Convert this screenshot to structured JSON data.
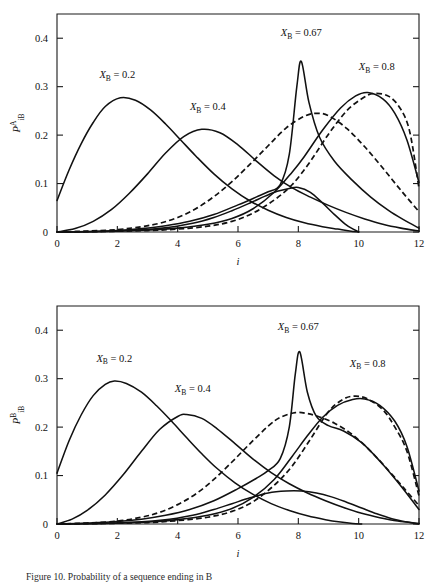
{
  "figure": {
    "caption": "Figure 10.  Probability of a sequence ending in B",
    "x_axis_label": "i",
    "line_styles": {
      "solid": "solid",
      "dashed": "dashed"
    },
    "ink_color": "#111111",
    "background_color": "#ffffff"
  },
  "chart_data": [
    {
      "id": "top",
      "type": "line",
      "title": "",
      "xlabel": "i",
      "ylabel": "P_iB^A",
      "ylabel_parts": {
        "base": "P",
        "sub": "iB",
        "sup": "A"
      },
      "xlim": [
        0,
        12
      ],
      "ylim": [
        0,
        0.45
      ],
      "xticks": [
        0,
        2,
        4,
        6,
        8,
        10,
        12
      ],
      "yticks": [
        0,
        0.1,
        0.2,
        0.3,
        0.4
      ],
      "xtick_labels": [
        "0",
        "2",
        "4",
        "6",
        "8",
        "10",
        "12"
      ],
      "ytick_labels": [
        "0",
        "0.1",
        "0.2",
        "0.3",
        "0.4"
      ],
      "grid": false,
      "legend": "inline-annotations",
      "annotations": [
        {
          "text": "X_B = 0.2",
          "base": "X",
          "sub": "B",
          "value": "0.2",
          "x": 2.0,
          "y": 0.318
        },
        {
          "text": "X_B = 0.4",
          "base": "X",
          "sub": "B",
          "value": "0.4",
          "x": 5.0,
          "y": 0.252
        },
        {
          "text": "X_B = 0.67",
          "base": "X",
          "sub": "B",
          "value": "0.67",
          "x": 8.1,
          "y": 0.404
        },
        {
          "text": "X_B = 0.8",
          "base": "X",
          "sub": "B",
          "value": "0.8",
          "x": 10.6,
          "y": 0.334
        }
      ],
      "series": [
        {
          "name": "X_B = 0.2",
          "style": "solid",
          "x": [
            0,
            0.4,
            0.8,
            1.2,
            1.6,
            2.1,
            2.6,
            3.1,
            3.6,
            4.1,
            4.6,
            5.2,
            5.8,
            6.4,
            7.0,
            7.6,
            8.2,
            8.8,
            9.3,
            9.7,
            10.0
          ],
          "values": [
            0.065,
            0.128,
            0.182,
            0.226,
            0.259,
            0.277,
            0.272,
            0.252,
            0.223,
            0.19,
            0.157,
            0.12,
            0.089,
            0.064,
            0.045,
            0.03,
            0.019,
            0.011,
            0.006,
            0.002,
            0.0
          ]
        },
        {
          "name": "X_B = 0.4",
          "style": "solid",
          "x": [
            0,
            0.6,
            1.2,
            1.8,
            2.4,
            3.0,
            3.6,
            4.2,
            4.8,
            5.4,
            6.0,
            6.6,
            7.2,
            7.8,
            8.4,
            9.0,
            9.6,
            10.2,
            10.8,
            11.4,
            12.0
          ],
          "values": [
            0.0,
            0.007,
            0.022,
            0.046,
            0.08,
            0.12,
            0.163,
            0.197,
            0.212,
            0.205,
            0.18,
            0.147,
            0.116,
            0.091,
            0.072,
            0.055,
            0.04,
            0.027,
            0.016,
            0.008,
            0.002
          ]
        },
        {
          "name": "X_B = 0.67 solid",
          "style": "solid",
          "x": [
            0,
            1.0,
            2.0,
            2.8,
            3.6,
            4.4,
            5.2,
            6.0,
            6.6,
            7.0,
            7.4,
            7.7,
            7.95,
            8.1,
            8.35,
            8.7,
            9.2,
            9.8,
            10.4,
            11.0,
            11.5,
            12.0
          ],
          "values": [
            0.0,
            0.001,
            0.003,
            0.007,
            0.013,
            0.022,
            0.036,
            0.056,
            0.072,
            0.083,
            0.098,
            0.16,
            0.3,
            0.352,
            0.268,
            0.196,
            0.146,
            0.106,
            0.072,
            0.044,
            0.025,
            0.008
          ]
        },
        {
          "name": "X_B = 0.67 dashed",
          "style": "dashed",
          "x": [
            0,
            1.0,
            2.0,
            2.8,
            3.4,
            4.0,
            4.6,
            5.2,
            5.8,
            6.4,
            7.0,
            7.6,
            8.2,
            8.6,
            9.0,
            9.6,
            10.2,
            10.8,
            11.4,
            12.0
          ],
          "values": [
            0.0,
            0.002,
            0.005,
            0.011,
            0.018,
            0.03,
            0.048,
            0.073,
            0.104,
            0.14,
            0.178,
            0.215,
            0.239,
            0.245,
            0.24,
            0.214,
            0.176,
            0.132,
            0.086,
            0.042
          ]
        },
        {
          "name": "X_B = 0.8 solid",
          "style": "solid",
          "x": [
            0,
            1.5,
            3.0,
            4.0,
            5.0,
            5.8,
            6.5,
            7.2,
            7.8,
            8.2,
            8.8,
            9.4,
            9.9,
            10.3,
            10.8,
            11.2,
            11.6,
            12.0
          ],
          "values": [
            0.0,
            0.001,
            0.004,
            0.008,
            0.016,
            0.028,
            0.048,
            0.082,
            0.124,
            0.156,
            0.21,
            0.256,
            0.281,
            0.288,
            0.275,
            0.245,
            0.19,
            0.102
          ]
        },
        {
          "name": "X_B = 0.8 dashed",
          "style": "dashed",
          "x": [
            0,
            1.5,
            3.0,
            4.0,
            5.0,
            5.8,
            6.5,
            7.2,
            7.8,
            8.4,
            9.0,
            9.6,
            10.1,
            10.5,
            11.0,
            11.4,
            11.7,
            12.0
          ],
          "values": [
            0.0,
            0.001,
            0.003,
            0.006,
            0.012,
            0.022,
            0.039,
            0.066,
            0.098,
            0.146,
            0.202,
            0.25,
            0.275,
            0.286,
            0.28,
            0.253,
            0.205,
            0.09
          ]
        },
        {
          "name": "low tail solid",
          "style": "solid",
          "x": [
            0,
            2.0,
            3.5,
            4.5,
            5.2,
            5.8,
            6.4,
            6.9,
            7.3,
            7.7,
            8.0,
            8.4,
            8.8,
            9.2,
            9.6,
            10.0
          ],
          "values": [
            0.0,
            0.002,
            0.008,
            0.018,
            0.03,
            0.044,
            0.06,
            0.074,
            0.084,
            0.09,
            0.092,
            0.082,
            0.06,
            0.036,
            0.014,
            0.0
          ]
        }
      ]
    },
    {
      "id": "bottom",
      "type": "line",
      "title": "",
      "xlabel": "i",
      "ylabel": "P_iB^B",
      "ylabel_parts": {
        "base": "P",
        "sub": "iB",
        "sup": "B"
      },
      "xlim": [
        0,
        12
      ],
      "ylim": [
        0,
        0.45
      ],
      "xticks": [
        0,
        2,
        4,
        6,
        8,
        10,
        12
      ],
      "yticks": [
        0,
        0.1,
        0.2,
        0.3,
        0.4
      ],
      "xtick_labels": [
        "0",
        "2",
        "4",
        "6",
        "8",
        "10",
        "12"
      ],
      "ytick_labels": [
        "0",
        "0.1",
        "0.2",
        "0.3",
        "0.4"
      ],
      "grid": false,
      "legend": "inline-annotations",
      "annotations": [
        {
          "text": "X_B = 0.2",
          "base": "X",
          "sub": "B",
          "value": "0.2",
          "x": 1.9,
          "y": 0.335
        },
        {
          "text": "X_B = 0.4",
          "base": "X",
          "sub": "B",
          "value": "0.4",
          "x": 4.5,
          "y": 0.272
        },
        {
          "text": "X_B = 0.67",
          "base": "X",
          "sub": "B",
          "value": "0.67",
          "x": 8.0,
          "y": 0.4
        },
        {
          "text": "X_B = 0.8",
          "base": "X",
          "sub": "B",
          "value": "0.8",
          "x": 10.3,
          "y": 0.325
        }
      ],
      "series": [
        {
          "name": "X_B = 0.2",
          "style": "solid",
          "x": [
            0,
            0.4,
            0.8,
            1.2,
            1.6,
            1.9,
            2.3,
            2.8,
            3.3,
            3.8,
            4.3,
            4.8,
            5.3,
            5.9,
            6.5,
            7.1,
            7.7,
            8.3,
            8.9,
            9.4,
            9.8,
            10.1
          ],
          "values": [
            0.105,
            0.172,
            0.225,
            0.265,
            0.288,
            0.295,
            0.29,
            0.272,
            0.244,
            0.212,
            0.178,
            0.145,
            0.115,
            0.085,
            0.061,
            0.042,
            0.028,
            0.017,
            0.009,
            0.004,
            0.001,
            0.0
          ]
        },
        {
          "name": "X_B = 0.4",
          "style": "solid",
          "x": [
            0,
            0.5,
            1.0,
            1.6,
            2.2,
            2.8,
            3.4,
            4.0,
            4.3,
            4.8,
            5.3,
            5.9,
            6.5,
            7.1,
            7.7,
            8.3,
            8.9,
            9.5,
            10.1,
            10.7,
            11.3,
            12.0
          ],
          "values": [
            0.0,
            0.01,
            0.028,
            0.06,
            0.102,
            0.15,
            0.195,
            0.222,
            0.226,
            0.218,
            0.197,
            0.166,
            0.134,
            0.106,
            0.083,
            0.064,
            0.048,
            0.034,
            0.022,
            0.013,
            0.006,
            0.001
          ]
        },
        {
          "name": "X_B = 0.67 solid",
          "style": "solid",
          "x": [
            0,
            1.0,
            2.0,
            2.8,
            3.6,
            4.4,
            5.2,
            6.0,
            6.6,
            7.0,
            7.4,
            7.7,
            7.9,
            8.05,
            8.3,
            8.6,
            9.0,
            9.5,
            10.1,
            10.7,
            11.3,
            12.0
          ],
          "values": [
            0.0,
            0.002,
            0.005,
            0.01,
            0.018,
            0.03,
            0.048,
            0.073,
            0.094,
            0.11,
            0.135,
            0.2,
            0.31,
            0.355,
            0.272,
            0.222,
            0.203,
            0.192,
            0.168,
            0.13,
            0.086,
            0.03
          ]
        },
        {
          "name": "X_B = 0.67 dashed",
          "style": "dashed",
          "x": [
            0,
            1.0,
            2.0,
            2.8,
            3.4,
            4.0,
            4.6,
            5.2,
            5.8,
            6.4,
            7.0,
            7.4,
            7.9,
            8.3,
            8.7,
            9.2,
            9.8,
            10.4,
            11.0,
            11.5,
            12.0
          ],
          "values": [
            0.0,
            0.002,
            0.006,
            0.014,
            0.024,
            0.04,
            0.062,
            0.092,
            0.128,
            0.166,
            0.202,
            0.22,
            0.23,
            0.228,
            0.221,
            0.208,
            0.184,
            0.15,
            0.11,
            0.074,
            0.038
          ]
        },
        {
          "name": "X_B = 0.8 solid",
          "style": "solid",
          "x": [
            0,
            1.5,
            3.0,
            4.0,
            5.0,
            5.8,
            6.5,
            7.2,
            7.8,
            8.3,
            8.8,
            9.3,
            9.8,
            10.2,
            10.7,
            11.2,
            11.6,
            12.0
          ],
          "values": [
            0.0,
            0.001,
            0.004,
            0.009,
            0.018,
            0.032,
            0.055,
            0.092,
            0.14,
            0.182,
            0.22,
            0.245,
            0.257,
            0.258,
            0.245,
            0.212,
            0.16,
            0.068
          ]
        },
        {
          "name": "X_B = 0.8 dashed",
          "style": "dashed",
          "x": [
            0,
            1.5,
            3.0,
            4.0,
            5.0,
            5.8,
            6.5,
            7.2,
            7.8,
            8.4,
            9.0,
            9.5,
            9.9,
            10.3,
            10.8,
            11.2,
            11.6,
            12.0
          ],
          "values": [
            0.0,
            0.001,
            0.003,
            0.007,
            0.014,
            0.026,
            0.046,
            0.08,
            0.12,
            0.175,
            0.232,
            0.258,
            0.264,
            0.258,
            0.236,
            0.2,
            0.15,
            0.058
          ]
        },
        {
          "name": "low tail solid",
          "style": "solid",
          "x": [
            0,
            2.0,
            3.5,
            4.5,
            5.2,
            5.8,
            6.4,
            7.0,
            7.6,
            8.1,
            8.6,
            9.1,
            9.6,
            10.1,
            10.6,
            11.1,
            11.6,
            12.0
          ],
          "values": [
            0.0,
            0.002,
            0.008,
            0.018,
            0.03,
            0.042,
            0.054,
            0.064,
            0.068,
            0.068,
            0.064,
            0.056,
            0.045,
            0.033,
            0.021,
            0.011,
            0.004,
            0.0
          ]
        }
      ]
    }
  ]
}
